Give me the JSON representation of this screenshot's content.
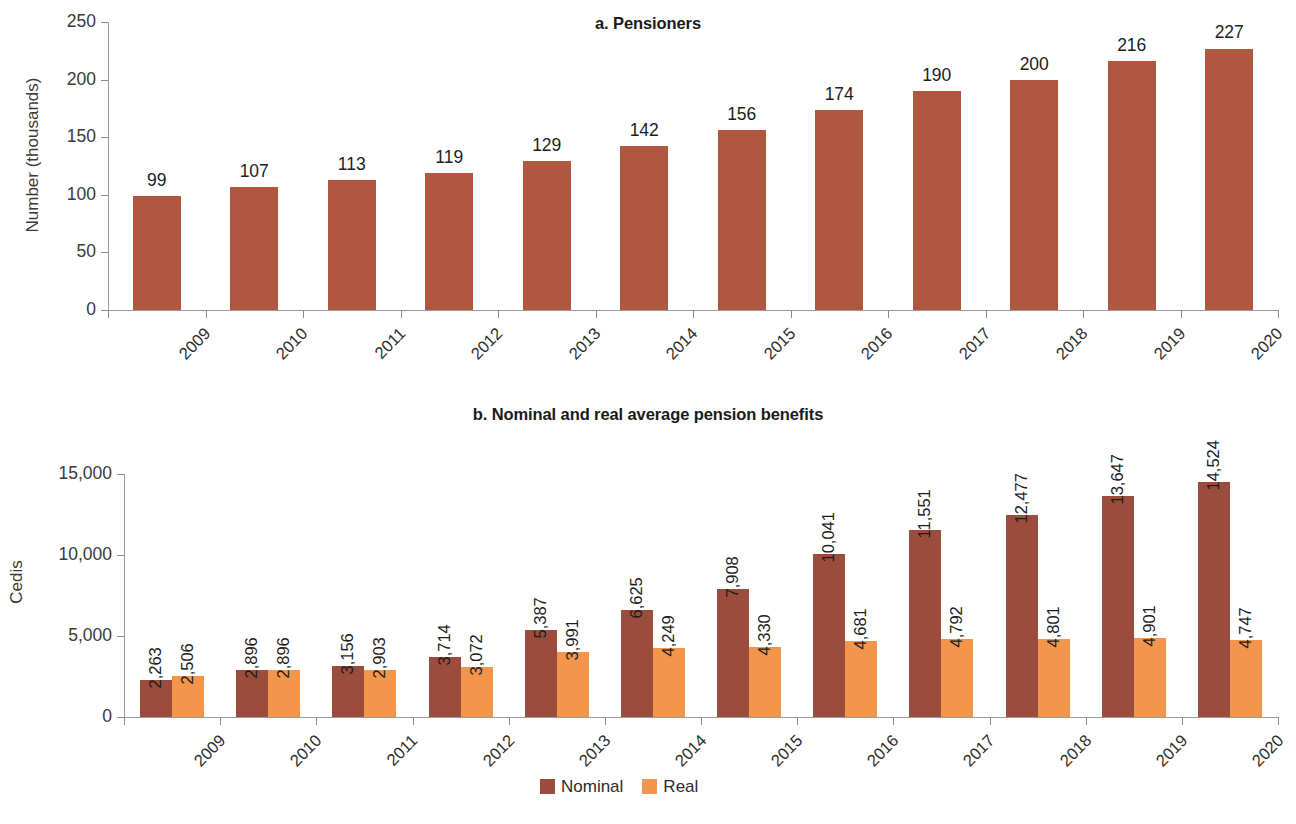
{
  "chart_data": [
    {
      "type": "bar",
      "panel": "a",
      "title": "a. Pensioners",
      "xlabel": "",
      "ylabel": "Number (thousands)",
      "categories": [
        "2009",
        "2010",
        "2011",
        "2012",
        "2013",
        "2014",
        "2015",
        "2016",
        "2017",
        "2018",
        "2019",
        "2020"
      ],
      "values": [
        99,
        107,
        113,
        119,
        129,
        142,
        156,
        174,
        190,
        200,
        216,
        227
      ],
      "value_labels": [
        "99",
        "107",
        "113",
        "119",
        "129",
        "142",
        "156",
        "174",
        "190",
        "200",
        "216",
        "227"
      ],
      "yticks": [
        0,
        50,
        100,
        150,
        200,
        250
      ],
      "ytick_labels": [
        "0",
        "50",
        "100",
        "150",
        "200",
        "250"
      ],
      "ylim": [
        0,
        250
      ],
      "grid": false,
      "legend": false,
      "series_color": "#b0573f"
    },
    {
      "type": "bar",
      "panel": "b",
      "title": "b. Nominal and real average pension benefits",
      "xlabel": "",
      "ylabel": "Cedis",
      "categories": [
        "2009",
        "2010",
        "2011",
        "2012",
        "2013",
        "2014",
        "2015",
        "2016",
        "2017",
        "2018",
        "2019",
        "2020"
      ],
      "series": [
        {
          "name": "Nominal",
          "color": "#9c4c3c",
          "values": [
            2263,
            2896,
            3156,
            3714,
            5387,
            6625,
            7908,
            10041,
            11551,
            12477,
            13647,
            14524
          ],
          "value_labels": [
            "2,263",
            "2,896",
            "3,156",
            "3,714",
            "5,387",
            "6,625",
            "7,908",
            "10,041",
            "11,551",
            "12,477",
            "13,647",
            "14,524"
          ]
        },
        {
          "name": "Real",
          "color": "#f4954c",
          "values": [
            2506,
            2896,
            2903,
            3072,
            3991,
            4249,
            4330,
            4681,
            4792,
            4801,
            4901,
            4747
          ],
          "value_labels": [
            "2,506",
            "2,896",
            "2,903",
            "3,072",
            "3,991",
            "4,249",
            "4,330",
            "4,681",
            "4,792",
            "4,801",
            "4,901",
            "4,747"
          ]
        }
      ],
      "yticks": [
        0,
        5000,
        10000,
        15000
      ],
      "ytick_labels": [
        "0",
        "5,000",
        "10,000",
        "15,000"
      ],
      "ylim": [
        0,
        15000
      ],
      "grid": false,
      "legend": true,
      "legend_position": "bottom-center",
      "legend_entries": [
        {
          "label": "Nominal",
          "color": "#9c4c3c"
        },
        {
          "label": "Real",
          "color": "#f4954c"
        }
      ]
    }
  ]
}
